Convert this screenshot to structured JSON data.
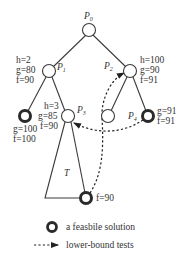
{
  "diagram": {
    "nodes": {
      "p0": {
        "label": "P",
        "sub": "0"
      },
      "p1": {
        "label": "P",
        "sub": "1",
        "h": "h=2",
        "g": "g=80",
        "f": "f=90"
      },
      "p2": {
        "label": "P",
        "sub": "2",
        "h": "h=100",
        "g": "g=90",
        "f": "f=91"
      },
      "p3": {
        "label": "P",
        "sub": "3",
        "h": "h=3",
        "g": "g=85",
        "f": "f=90"
      },
      "p4": {
        "label": "P",
        "sub": "4",
        "g": "g=91",
        "f": "f=91"
      },
      "leaf_left": {
        "g": "g=100",
        "f": "f=100"
      },
      "leaf_bottom": {
        "f": "f=90"
      }
    },
    "subtree_label": "T"
  },
  "legend": {
    "feasible": "a feasbile solution",
    "lower_bound": "lower-bound tests"
  },
  "colors": {
    "line": "#3a3a3a",
    "text": "#333333"
  }
}
